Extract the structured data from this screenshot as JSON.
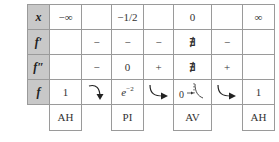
{
  "table": {
    "row_headers": [
      "x",
      "f′",
      "f″",
      "f"
    ],
    "x_row": [
      "−∞",
      "",
      "−1/2",
      "",
      "0",
      "",
      "∞"
    ],
    "f_prime_row": [
      "",
      "−",
      "−",
      "−",
      "∄",
      "−",
      ""
    ],
    "f_double_prime_row": [
      "",
      "−",
      "0",
      "+",
      "∄",
      "+",
      ""
    ],
    "f_row": {
      "c1": "1",
      "c2_arrow": "decreasing-concave-down",
      "c3_base": "e",
      "c3_exp": "−2",
      "c4_arrow": "decreasing-concave-up",
      "c5_value": "0",
      "c5_asymptote": "vertical-asymptote-marker",
      "c6_arrow": "decreasing-concave-up",
      "c7": "1"
    }
  },
  "labels": [
    {
      "text": "AH",
      "column": 1
    },
    {
      "text": "PI",
      "column": 3
    },
    {
      "text": "AV",
      "column": 5
    },
    {
      "text": "AH",
      "column": 7
    }
  ],
  "colors": {
    "header_bg": "#c8c8c8",
    "border": "#9a9a9a",
    "text": "#333333"
  }
}
